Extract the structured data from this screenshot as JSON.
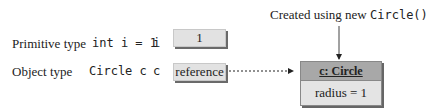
{
  "caption": {
    "prefix": "Created using new ",
    "code": "Circle()"
  },
  "rows": [
    {
      "type_label": "Primitive type",
      "decl": "int i = 1",
      "var": "i",
      "value": "1"
    },
    {
      "type_label": "Object type",
      "decl": "Circle c",
      "var": "c",
      "value": "reference"
    }
  ],
  "object": {
    "name": "c: Circle",
    "field": "radius = 1"
  },
  "colors": {
    "box_fill": "#e2e2e2",
    "header_fill": "#a8a8a8",
    "shadow": "#6a6a6a"
  }
}
